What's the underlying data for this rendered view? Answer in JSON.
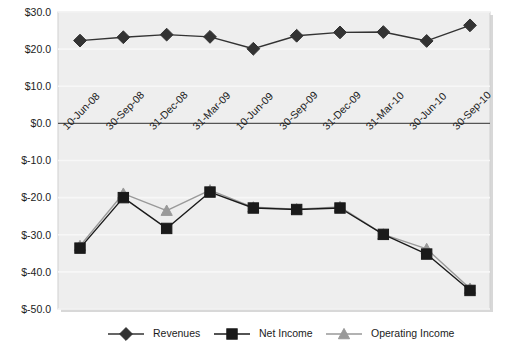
{
  "chart_data": {
    "type": "line",
    "title": "",
    "xlabel": "",
    "ylabel": "",
    "grid": true,
    "legend_position": "bottom",
    "ylim": [
      -50,
      30
    ],
    "ytick_step": 10,
    "ytick_labels": [
      "$30.0",
      "$20.0",
      "$10.0",
      "$0.0",
      "$-10.0",
      "$-20.0",
      "$-30.0",
      "$-40.0",
      "$-50.0"
    ],
    "ytick_values": [
      30,
      20,
      10,
      0,
      -10,
      -20,
      -30,
      -40,
      -50
    ],
    "categories": [
      "10-Jun-08",
      "30-Sep-08",
      "31-Dec-08",
      "31-Mar-09",
      "10-Jun-09",
      "30-Sep-09",
      "31-Dec-09",
      "31-Mar-10",
      "30-Jun-10",
      "30-Sep-10"
    ],
    "series": [
      {
        "name": "Revenues",
        "marker": "diamond",
        "color": "#333333",
        "values": [
          22.3,
          23.2,
          23.9,
          23.3,
          20.1,
          23.6,
          24.5,
          24.6,
          22.2,
          26.4
        ]
      },
      {
        "name": "Net Income",
        "marker": "square",
        "color": "#1a1a1a",
        "values": [
          -33.6,
          -20.0,
          -28.3,
          -18.5,
          -22.8,
          -23.2,
          -22.8,
          -29.9,
          -35.2,
          -45.0
        ]
      },
      {
        "name": "Operating Income",
        "marker": "triangle",
        "color": "#999999",
        "values": [
          -33.0,
          -18.9,
          -23.5,
          -18.0,
          -22.6,
          -23.1,
          -22.5,
          -29.9,
          -33.8,
          -44.5
        ]
      }
    ]
  },
  "colors": {
    "plot_background": "#eeeeee",
    "gridline": "#f7f7f7",
    "zero_axis": "#555555",
    "plot_border": "#cccccc",
    "revenues": "#333333",
    "net_income": "#1a1a1a",
    "operating_income": "#999999"
  },
  "legend": {
    "items": [
      {
        "label": "Revenues",
        "marker": "diamond-icon",
        "color": "#333333"
      },
      {
        "label": "Net Income",
        "marker": "square-icon",
        "color": "#1a1a1a"
      },
      {
        "label": "Operating Income",
        "marker": "triangle-icon",
        "color": "#999999"
      }
    ]
  }
}
